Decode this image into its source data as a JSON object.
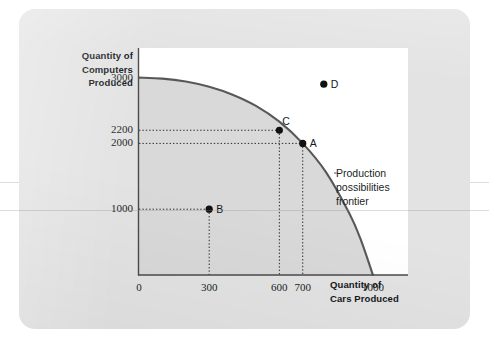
{
  "figure": {
    "card_background": "#e3e3e3",
    "panel_background": "#ffffff"
  },
  "axes": {
    "y_title_lines": [
      "Quantity of",
      "Computers",
      "Produced"
    ],
    "x_title_lines": [
      "Quantity of",
      "Cars Produced"
    ]
  },
  "annotation": {
    "lines": [
      "Production",
      "possibilities",
      "frontier"
    ]
  },
  "chart_data": {
    "type": "line",
    "title": "",
    "subtitle": "",
    "xlabel": "Quantity of Cars Produced",
    "ylabel": "Quantity of Computers Produced",
    "xlim": [
      0,
      1150
    ],
    "ylim": [
      0,
      3450
    ],
    "grid": false,
    "legend_position": "inline-annotation",
    "annotations": [
      {
        "text": "Production possibilities frontier",
        "target": "frontier-curve",
        "leader_line": true
      }
    ],
    "xticks": [
      {
        "value": 0,
        "label": "0"
      },
      {
        "value": 300,
        "label": "300"
      },
      {
        "value": 600,
        "label": "600"
      },
      {
        "value": 700,
        "label": "700"
      },
      {
        "value": 1000,
        "label": "1000"
      }
    ],
    "yticks": [
      {
        "value": 1000,
        "label": "1000"
      },
      {
        "value": 2000,
        "label": "2000"
      },
      {
        "value": 2200,
        "label": "2200"
      },
      {
        "value": 3000,
        "label": "3000"
      }
    ],
    "series": [
      {
        "name": "Production possibilities frontier",
        "type": "line",
        "color": "#58585a",
        "fill": "#d9d9d9",
        "x": [
          0,
          100,
          200,
          300,
          400,
          500,
          600,
          700,
          800,
          900,
          950,
          1000
        ],
        "y": [
          3000,
          2985,
          2940,
          2860,
          2740,
          2570,
          2330,
          2000,
          1560,
          930,
          520,
          0
        ]
      }
    ],
    "points": [
      {
        "label": "A",
        "x": 700,
        "y": 2000,
        "position": "on-frontier",
        "guides": [
          "horizontal",
          "vertical"
        ]
      },
      {
        "label": "B",
        "x": 300,
        "y": 1000,
        "position": "inside-frontier",
        "guides": [
          "horizontal",
          "vertical"
        ]
      },
      {
        "label": "C",
        "x": 600,
        "y": 2200,
        "position": "on-frontier",
        "guides": [
          "horizontal",
          "vertical"
        ]
      },
      {
        "label": "D",
        "x": 790,
        "y": 2900,
        "position": "outside-frontier",
        "guides": []
      }
    ]
  }
}
